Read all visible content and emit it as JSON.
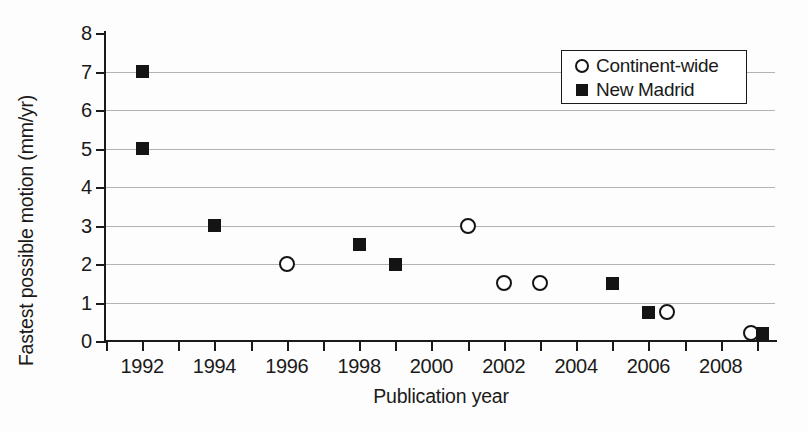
{
  "chart_data": {
    "type": "scatter",
    "title": "",
    "xlabel": "Publication year",
    "ylabel": "Fastest possible motion (mm/yr)",
    "xlim": [
      1991,
      2009.5
    ],
    "ylim": [
      0,
      8
    ],
    "yticks": [
      0,
      1,
      2,
      3,
      4,
      5,
      6,
      7,
      8
    ],
    "ytick_labels": [
      "0",
      "1",
      "2",
      "3",
      "4",
      "5",
      "6",
      "7",
      "8"
    ],
    "xticks": [
      1991,
      1992,
      1993,
      1994,
      1995,
      1996,
      1997,
      1998,
      1999,
      2000,
      2001,
      2002,
      2003,
      2004,
      2005,
      2006,
      2007,
      2008,
      2009
    ],
    "xtick_labels": [
      {
        "value": 1992,
        "label": "1992"
      },
      {
        "value": 1994,
        "label": "1994"
      },
      {
        "value": 1996,
        "label": "1996"
      },
      {
        "value": 1998,
        "label": "1998"
      },
      {
        "value": 2000,
        "label": "2000"
      },
      {
        "value": 2002,
        "label": "2002"
      },
      {
        "value": 2004,
        "label": "2004"
      },
      {
        "value": 2006,
        "label": "2006"
      },
      {
        "value": 2008,
        "label": "2008"
      }
    ],
    "grid": "horizontal",
    "legend_position": "top-right",
    "series": [
      {
        "name": "Continent-wide",
        "marker": "open-circle",
        "color": "#141414",
        "points": [
          {
            "x": 1996,
            "y": 2.0
          },
          {
            "x": 2001,
            "y": 3.0
          },
          {
            "x": 2002,
            "y": 1.5
          },
          {
            "x": 2003,
            "y": 1.5
          },
          {
            "x": 2006.5,
            "y": 0.75
          },
          {
            "x": 2008.85,
            "y": 0.2
          }
        ]
      },
      {
        "name": "New Madrid",
        "marker": "filled-square",
        "color": "#141414",
        "points": [
          {
            "x": 1992,
            "y": 7.0
          },
          {
            "x": 1992,
            "y": 5.0
          },
          {
            "x": 1994,
            "y": 3.0
          },
          {
            "x": 1998,
            "y": 2.5
          },
          {
            "x": 1999,
            "y": 2.0
          },
          {
            "x": 2005,
            "y": 1.5
          },
          {
            "x": 2006,
            "y": 0.75
          },
          {
            "x": 2009.15,
            "y": 0.2
          }
        ]
      }
    ]
  },
  "legend": {
    "entries": [
      {
        "label": "Continent-wide",
        "marker": "open-circle"
      },
      {
        "label": "New Madrid",
        "marker": "filled-square"
      }
    ]
  }
}
